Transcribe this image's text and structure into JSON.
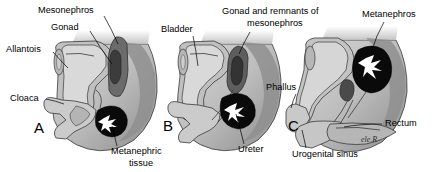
{
  "figure": {
    "background_color": "#ffffff",
    "signature": "ele.R"
  },
  "palette": {
    "body_light": "#c9c9c9",
    "body_mid": "#b0b0b0",
    "body_dark": "#8f8f8f",
    "body_deep": "#6e6e6e",
    "kidney_black": "#0a0a0a",
    "calyx_white": "#ffffff",
    "outline": "#3a3a3a",
    "label_text": "#000000"
  },
  "panels": [
    {
      "letter": "A",
      "letter_pos": {
        "x": 34,
        "y": 133
      },
      "labels": [
        {
          "name": "mesonephros",
          "text": "Mesonephros",
          "x": 38,
          "y": 11,
          "anchor": "start"
        },
        {
          "name": "gonad",
          "text": "Gonad",
          "x": 51,
          "y": 28,
          "anchor": "start"
        },
        {
          "name": "allantois",
          "text": "Allantois",
          "x": 8,
          "y": 50,
          "anchor": "start"
        },
        {
          "name": "cloaca",
          "text": "Cloaca",
          "x": 10,
          "y": 99,
          "anchor": "start"
        },
        {
          "name": "metanephric-tissue-line1",
          "text": "Metanephric",
          "x": 111,
          "y": 152,
          "anchor": "start"
        },
        {
          "name": "metanephric-tissue-line2",
          "text": "tissue",
          "x": 126,
          "y": 164,
          "anchor": "start"
        }
      ]
    },
    {
      "letter": "B",
      "letter_pos": {
        "x": 163,
        "y": 131
      },
      "labels": [
        {
          "name": "bladder",
          "text": "Bladder",
          "x": 161,
          "y": 30,
          "anchor": "start"
        },
        {
          "name": "gonad-remnants-line1",
          "text": "Gonad and remnants of",
          "x": 222,
          "y": 12,
          "anchor": "start"
        },
        {
          "name": "gonad-remnants-line2",
          "text": "mesonephros",
          "x": 247,
          "y": 24,
          "anchor": "start"
        },
        {
          "name": "ureter",
          "text": "Ureter",
          "x": 238,
          "y": 150,
          "anchor": "start"
        }
      ]
    },
    {
      "letter": "C",
      "letter_pos": {
        "x": 288,
        "y": 131
      },
      "labels": [
        {
          "name": "metanephros",
          "text": "Metanephros",
          "x": 362,
          "y": 15,
          "anchor": "start"
        },
        {
          "name": "phallus",
          "text": "Phallus",
          "x": 268,
          "y": 88,
          "anchor": "start"
        },
        {
          "name": "rectum",
          "text": "Rectum",
          "x": 384,
          "y": 124,
          "anchor": "start"
        },
        {
          "name": "urogenital-sinus",
          "text": "Urogenital sinus",
          "x": 292,
          "y": 155,
          "anchor": "start"
        }
      ]
    }
  ]
}
